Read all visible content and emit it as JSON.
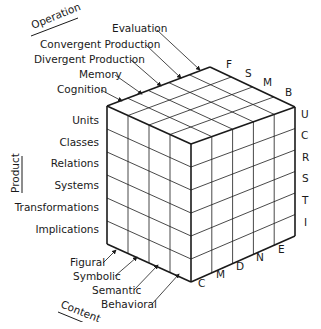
{
  "diagram": {
    "axes": {
      "operation": {
        "title": "Operation",
        "items": [
          "Evaluation",
          "Convergent Production",
          "Divergent Production",
          "Memory",
          "Cognition"
        ],
        "letters": [
          "F",
          "S",
          "M",
          "B"
        ]
      },
      "product": {
        "title": "Product",
        "items": [
          "Units",
          "Classes",
          "Relations",
          "Systems",
          "Transformations",
          "Implications"
        ],
        "letters": [
          "U",
          "C",
          "R",
          "S",
          "T",
          "I"
        ]
      },
      "content": {
        "title": "Content",
        "items": [
          "Figural",
          "Symbolic",
          "Semantic",
          "Behavioral"
        ],
        "letters": [
          "C",
          "M",
          "D",
          "N",
          "E"
        ]
      }
    },
    "colors": {
      "line": "#1a1a1a",
      "background": "#ffffff"
    }
  }
}
